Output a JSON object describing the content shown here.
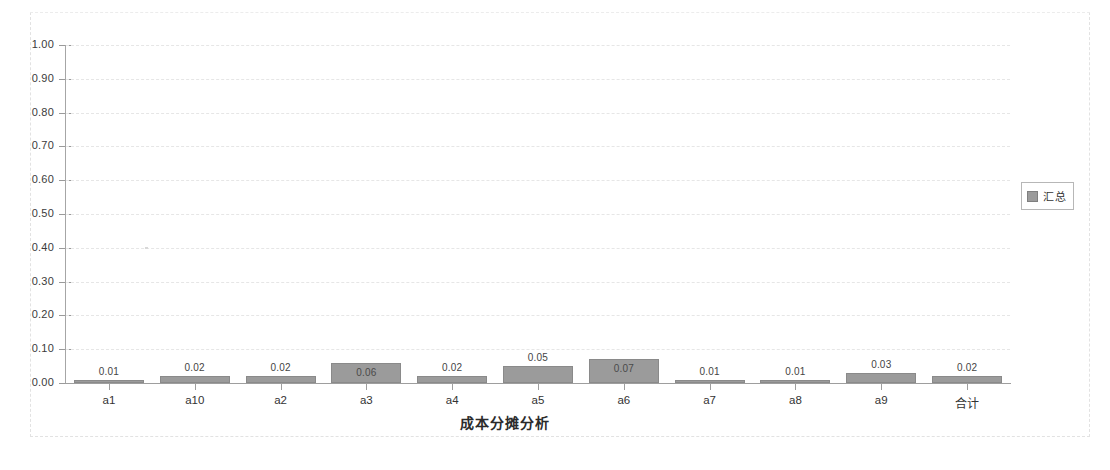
{
  "chart_data": {
    "type": "bar",
    "title": "",
    "xlabel": "成本分摊分析",
    "ylabel": "",
    "categories": [
      "a1",
      "a10",
      "a2",
      "a3",
      "a4",
      "a5",
      "a6",
      "a7",
      "a8",
      "a9",
      "合计"
    ],
    "values": [
      0.01,
      0.02,
      0.02,
      0.06,
      0.02,
      0.05,
      0.07,
      0.01,
      0.01,
      0.03,
      0.02
    ],
    "data_labels": [
      "0.01",
      "0.02",
      "0.02",
      "0.06",
      "0.02",
      "0.05",
      "0.07",
      "0.01",
      "0.01",
      "0.03",
      "0.02"
    ],
    "label_position": [
      "above",
      "above",
      "above",
      "inside",
      "above",
      "above",
      "inside",
      "above",
      "above",
      "above",
      "above"
    ],
    "series": [
      {
        "name": "汇总",
        "values": [
          0.01,
          0.02,
          0.02,
          0.06,
          0.02,
          0.05,
          0.07,
          0.01,
          0.01,
          0.03,
          0.02
        ],
        "color": "#9b9b9b"
      }
    ],
    "ylim": [
      0.0,
      1.0
    ],
    "ytick_step": 0.1,
    "ytick_labels": [
      "1.00",
      "0.90",
      "0.80",
      "0.70",
      "0.60",
      "0.50",
      "0.40",
      "0.30",
      "0.20",
      "0.10",
      "0.00"
    ],
    "ytick_values": [
      1.0,
      0.9,
      0.8,
      0.7,
      0.6,
      0.5,
      0.4,
      0.3,
      0.2,
      0.1,
      0.0
    ],
    "grid": true,
    "grid_style": "dashed",
    "legend": {
      "position": "right",
      "entries": [
        {
          "label": "汇总",
          "color": "#9b9b9b"
        }
      ]
    },
    "colors": {
      "bar_fill": "#9b9b9b",
      "bar_border": "#8a8a8a",
      "axis": "#9e9e9e",
      "grid": "#e6e6e6",
      "text": "#333333",
      "frame": "#e2e2e2",
      "background": "#ffffff"
    }
  },
  "legend": {
    "swatch_name": "series-color-swatch",
    "label": "汇总"
  },
  "axis": {
    "x_title": "成本分摊分析"
  }
}
